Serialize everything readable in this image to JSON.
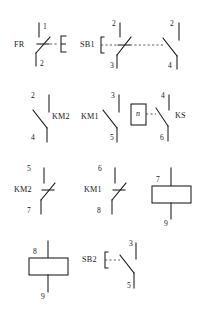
{
  "diagram": {
    "background_color": "#ffffff",
    "line_color": "#1a1a1a",
    "width": 200,
    "height": 322
  },
  "symbols": [
    {
      "id": "fr-thermal-relay",
      "device_label": "FR",
      "type": "thermal-overload-relay-nc-contact",
      "terminals": [
        "1",
        "2"
      ],
      "row": 1
    },
    {
      "id": "sb1-pushbutton-nc",
      "device_label": "SB1",
      "type": "pushbutton-nc-contact",
      "terminals": [
        "2",
        "3"
      ],
      "row": 1
    },
    {
      "id": "sb1-pushbutton-no",
      "device_label": "",
      "type": "pushbutton-no-contact",
      "terminals": [
        "2",
        "4"
      ],
      "row": 1
    },
    {
      "id": "km2-no-contact",
      "device_label": "KM2",
      "type": "contactor-no-contact",
      "terminals": [
        "2",
        "4"
      ],
      "row": 2
    },
    {
      "id": "km1-no-contact",
      "device_label": "KM1",
      "type": "contactor-no-contact",
      "terminals": [
        "3",
        "5"
      ],
      "row": 2
    },
    {
      "id": "ks-speed-relay",
      "device_label": "KS",
      "type": "speed-relay-no-contact",
      "box_label": "n",
      "terminals": [
        "4",
        "6"
      ],
      "row": 2
    },
    {
      "id": "km2-nc-contact",
      "device_label": "KM2",
      "type": "contactor-nc-contact",
      "terminals": [
        "5",
        "7"
      ],
      "row": 3
    },
    {
      "id": "km1-nc-contact",
      "device_label": "KM1",
      "type": "contactor-nc-contact",
      "terminals": [
        "6",
        "8"
      ],
      "row": 3
    },
    {
      "id": "coil-7-9",
      "device_label": "",
      "type": "relay-coil",
      "terminals": [
        "7",
        "9"
      ],
      "row": 3
    },
    {
      "id": "coil-8-9",
      "device_label": "",
      "type": "relay-coil",
      "terminals": [
        "8",
        "9"
      ],
      "row": 4
    },
    {
      "id": "sb2-pushbutton-no",
      "device_label": "SB2",
      "type": "pushbutton-no-contact",
      "terminals": [
        "3",
        "5"
      ],
      "row": 4
    }
  ],
  "labels": {
    "fr": "FR",
    "fr_t1": "1",
    "fr_t2": "2",
    "sb1": "SB1",
    "sb1_t2": "2",
    "sb1_t3": "3",
    "sb1b_t2": "2",
    "sb1b_t4": "4",
    "km2a": "KM2",
    "km2a_t2": "2",
    "km2a_t4": "4",
    "km1a": "KM1",
    "km1a_t3": "3",
    "km1a_t5": "5",
    "ks": "KS",
    "ks_n": "n",
    "ks_t4": "4",
    "ks_t6": "6",
    "km2b": "KM2",
    "km2b_t5": "5",
    "km2b_t7": "7",
    "km1b": "KM1",
    "km1b_t6": "6",
    "km1b_t8": "8",
    "coil1_t7": "7",
    "coil1_t9": "9",
    "coil2_t8": "8",
    "coil2_t9": "9",
    "sb2": "SB2",
    "sb2_t3": "3",
    "sb2_t5": "5"
  }
}
